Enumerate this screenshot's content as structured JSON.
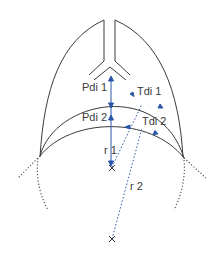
{
  "diagram": {
    "labels": {
      "pdi1": "Pdi 1",
      "pdi2": "Pdi 2",
      "tdi1": "Tdi 1",
      "tdi2": "Tdi 2",
      "r1": "r 1",
      "r2": "r 2"
    },
    "colors": {
      "outline": "#3a3a3a",
      "vector": "#2b55a8",
      "dotted": "#555555"
    }
  }
}
